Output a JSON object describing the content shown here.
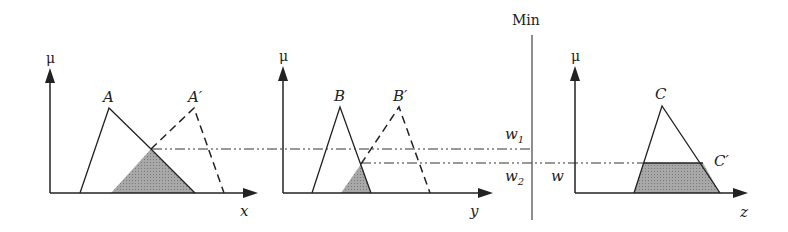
{
  "colors": {
    "line": "#222222",
    "shade": "#9a9a9a",
    "background": "#ffffff"
  },
  "panels": [
    {
      "id": "x",
      "axis_label": "x",
      "mu_label": "μ",
      "solid_label": "A",
      "dashed_label": "A′"
    },
    {
      "id": "y",
      "axis_label": "y",
      "mu_label": "μ",
      "solid_label": "B",
      "dashed_label": "B′"
    },
    {
      "id": "z",
      "axis_label": "z",
      "mu_label": "μ",
      "solid_label": "C",
      "result_label": "C′"
    }
  ],
  "min_operator": {
    "label": "Min"
  },
  "levels": {
    "w1": "w",
    "w1_sub": "1",
    "w2": "w",
    "w2_sub": "2",
    "w": "w"
  }
}
